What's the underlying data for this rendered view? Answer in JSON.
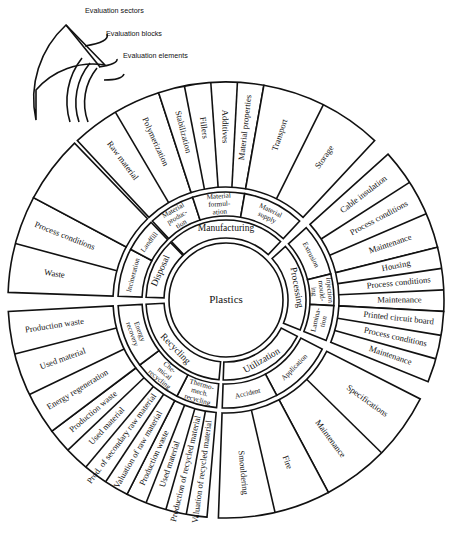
{
  "legend": {
    "sectors_label": "Evaluation sectors",
    "blocks_label": "Evaluation blocks",
    "elements_label": "Evaluation elements"
  },
  "center": {
    "label": "Plastics"
  },
  "sectors": [
    {
      "name": "Manufacturing",
      "blocks": [
        {
          "name": "Material produc-tion",
          "elements": [
            "Raw material",
            "Polymerization"
          ]
        },
        {
          "name": "Material formul-ation",
          "elements": [
            "Stabilization",
            "Fillers",
            "Additives",
            "Material properties"
          ]
        },
        {
          "name": "Material supply",
          "elements": [
            "Transport",
            "Storage"
          ]
        }
      ]
    },
    {
      "name": "Processing",
      "blocks": [
        {
          "name": "Extrusion",
          "elements": [
            "Cable insulation",
            "Process conditions",
            "Maintenance"
          ]
        },
        {
          "name": "Injection mould-ing",
          "elements": [
            "Housing",
            "Process conditions",
            "Maintenance"
          ]
        },
        {
          "name": "Lamina-tion",
          "elements": [
            "Printed circuit board",
            "Process conditions",
            "Maintenance"
          ]
        }
      ]
    },
    {
      "name": "Utilization",
      "blocks": [
        {
          "name": "Application",
          "elements": [
            "Specifications",
            "Maintenance"
          ]
        },
        {
          "name": "Accident",
          "elements": [
            "Fire",
            "Smouldering"
          ]
        }
      ]
    },
    {
      "name": "Recycling",
      "blocks": [
        {
          "name": "Thermo-mech. recycling",
          "elements": [
            "Valuation of recycled material",
            "Production of recycled material",
            "Used material",
            "Production waste"
          ]
        },
        {
          "name": "Che-mical recycling",
          "elements": [
            "Valuation of raw material",
            "Prod. of secondary raw material",
            "Used material",
            "Production waste"
          ]
        },
        {
          "name": "Energy recovery",
          "elements": [
            "Energy regeneration",
            "Used material",
            "Production waste"
          ]
        }
      ]
    },
    {
      "name": "Disposal",
      "blocks": [
        {
          "name": "Incineration",
          "elements": [
            "Waste",
            "Process conditions"
          ]
        },
        {
          "name": "Landfill",
          "elements": [
            ""
          ]
        }
      ]
    }
  ]
}
